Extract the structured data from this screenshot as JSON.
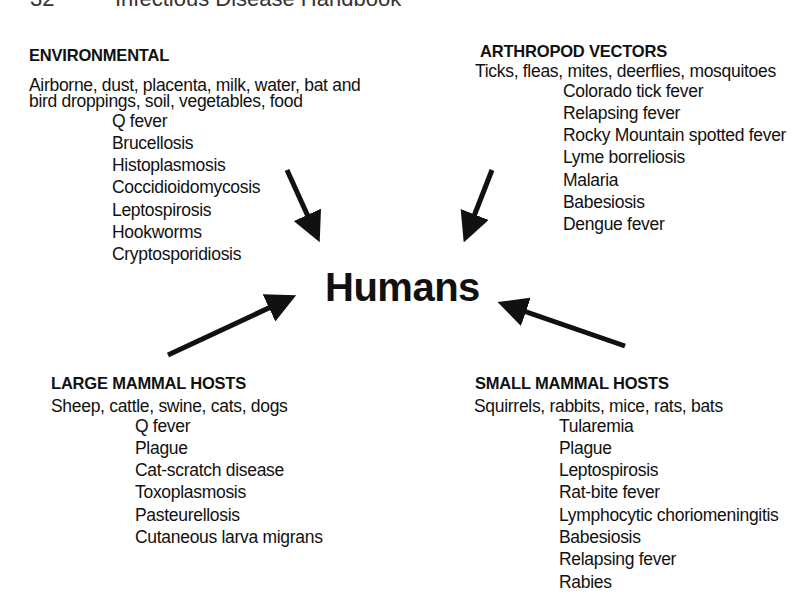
{
  "page_header": {
    "page_number": "32",
    "running_title": "Infectious Disease Handbook"
  },
  "center": {
    "label": "Humans"
  },
  "groups": [
    {
      "id": "environmental",
      "heading": "ENVIRONMENTAL",
      "sources": [
        "Airborne, dust, placenta, milk, water, bat and",
        "bird droppings, soil, vegetables, food"
      ],
      "diseases": [
        "Q fever",
        "Brucellosis",
        "Histoplasmosis",
        "Coccidioidomycosis",
        "Leptospirosis",
        "Hookworms",
        "Cryptosporidiosis"
      ]
    },
    {
      "id": "arthropod-vectors",
      "heading": "ARTHROPOD VECTORS",
      "sources": [
        "Ticks, fleas, mites, deerflies, mosquitoes"
      ],
      "diseases": [
        "Colorado tick fever",
        "Relapsing fever",
        "Rocky Mountain spotted fever",
        "Lyme borreliosis",
        "Malaria",
        "Babesiosis",
        "Dengue fever"
      ]
    },
    {
      "id": "large-mammal-hosts",
      "heading": "LARGE MAMMAL HOSTS",
      "sources": [
        "Sheep, cattle, swine, cats, dogs"
      ],
      "diseases": [
        "Q fever",
        "Plague",
        "Cat-scratch disease",
        "Toxoplasmosis",
        "Pasteurellosis",
        "Cutaneous larva migrans"
      ]
    },
    {
      "id": "small-mammal-hosts",
      "heading": "SMALL MAMMAL HOSTS",
      "sources": [
        "Squirrels, rabbits, mice, rats, bats"
      ],
      "diseases": [
        "Tularemia",
        "Plague",
        "Leptospirosis",
        "Rat-bite fever",
        "Lymphocytic choriomeningitis",
        "Babesiosis",
        "Relapsing fever",
        "Rabies"
      ]
    }
  ],
  "edges": [
    {
      "from": "environmental",
      "to": "humans"
    },
    {
      "from": "arthropod-vectors",
      "to": "humans"
    },
    {
      "from": "large-mammal-hosts",
      "to": "humans"
    },
    {
      "from": "small-mammal-hosts",
      "to": "humans"
    }
  ],
  "colors": {
    "ink": "#111111",
    "background": "#ffffff"
  }
}
